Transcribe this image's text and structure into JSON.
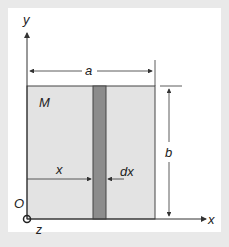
{
  "diagram": {
    "type": "thin rectangular plate with vertical strip element",
    "labels": {
      "y_axis": "y",
      "x_axis": "x",
      "z_axis": "z",
      "origin": "O",
      "mass": "M",
      "width": "a",
      "height": "b",
      "strip_position": "x",
      "strip_width": "dx"
    },
    "colors": {
      "plate": "#e3e3e3",
      "strip": "#8c8c8c",
      "lines": "#333333",
      "background": "#e9e9e9",
      "panel": "#ffffff"
    }
  }
}
